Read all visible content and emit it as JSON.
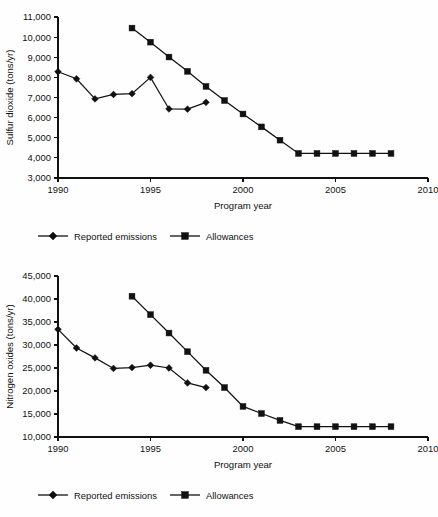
{
  "chart_data": [
    {
      "id": "so2",
      "type": "line",
      "title": "",
      "xlabel": "Program year",
      "ylabel": "Sulfur dioxide (tons/yr)",
      "xlim": [
        1990,
        2010
      ],
      "ylim": [
        3000,
        11000
      ],
      "xticks": [
        1990,
        1995,
        2000,
        2005,
        2010
      ],
      "xticklabels": [
        "1990",
        "1995",
        "2000",
        "2005",
        "2010"
      ],
      "yticks": [
        3000,
        4000,
        5000,
        6000,
        7000,
        8000,
        9000,
        10000,
        11000
      ],
      "yticklabels": [
        "3,000",
        "4,000",
        "5,000",
        "6,000",
        "7,000",
        "8,000",
        "9,000",
        "10,000",
        "11,000"
      ],
      "grid": false,
      "legend_position": "below",
      "series": [
        {
          "name": "Reported emissions",
          "marker": "diamond",
          "x": [
            1990,
            1991,
            1992,
            1993,
            1994,
            1995,
            1996,
            1997,
            1998
          ],
          "values": [
            8280,
            7930,
            6930,
            7150,
            7190,
            8000,
            6430,
            6420,
            6760
          ]
        },
        {
          "name": "Allowances",
          "marker": "square",
          "x": [
            1994,
            1995,
            1996,
            1997,
            1998,
            1999,
            2000,
            2001,
            2002,
            2003,
            2004,
            2005,
            2006,
            2007,
            2008
          ],
          "values": [
            10450,
            9750,
            9010,
            8300,
            7550,
            6850,
            6180,
            5540,
            4880,
            4220,
            4220,
            4220,
            4220,
            4220,
            4220
          ]
        }
      ]
    },
    {
      "id": "nox",
      "type": "line",
      "title": "",
      "xlabel": "Program year",
      "ylabel": "Nitrogen oxides (tons/yr)",
      "xlim": [
        1990,
        2010
      ],
      "ylim": [
        10000,
        45000
      ],
      "xticks": [
        1990,
        1995,
        2000,
        2005,
        2010
      ],
      "xticklabels": [
        "1990",
        "1995",
        "2000",
        "2005",
        "2010"
      ],
      "yticks": [
        10000,
        15000,
        20000,
        25000,
        30000,
        35000,
        40000,
        45000
      ],
      "yticklabels": [
        "10,000",
        "15,000",
        "20,000",
        "25,000",
        "30,000",
        "35,000",
        "40,000",
        "45,000"
      ],
      "grid": false,
      "legend_position": "below",
      "series": [
        {
          "name": "Reported emissions",
          "marker": "diamond",
          "x": [
            1990,
            1991,
            1992,
            1993,
            1994,
            1995,
            1996,
            1997,
            1998
          ],
          "values": [
            33400,
            29350,
            27200,
            24900,
            25100,
            25600,
            25000,
            21750,
            20750
          ]
        },
        {
          "name": "Allowances",
          "marker": "square",
          "x": [
            1994,
            1995,
            1996,
            1997,
            1998,
            1999,
            2000,
            2001,
            2002,
            2003,
            2004,
            2005,
            2006,
            2007,
            2008
          ],
          "values": [
            40600,
            36600,
            32600,
            28550,
            24500,
            20750,
            16650,
            15100,
            13600,
            12250,
            12250,
            12250,
            12250,
            12250,
            12250
          ]
        }
      ]
    }
  ]
}
